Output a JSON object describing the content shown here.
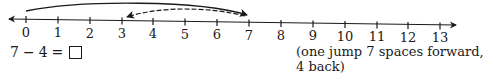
{
  "number_line": {
    "min": 0,
    "max": 13,
    "ticks": [
      "0",
      "1",
      "2",
      "3",
      "4",
      "5",
      "6",
      "7",
      "8",
      "9",
      "10",
      "11",
      "12",
      "13"
    ],
    "arrows": "both-ends"
  },
  "jumps": [
    {
      "name": "forward-jump",
      "from": 0,
      "to": 7,
      "style": "solid"
    },
    {
      "name": "back-jump",
      "from": 7,
      "to": 3,
      "style": "dashed"
    }
  ],
  "equation": {
    "left": "7",
    "operator": "−",
    "right": "4",
    "equals": "=",
    "answer": ""
  },
  "caption": {
    "line1": "(one jump 7 spaces forward,",
    "line2": "4 back)"
  },
  "colors": {
    "ink": "#1a1a1a",
    "background": "#ffffff"
  }
}
